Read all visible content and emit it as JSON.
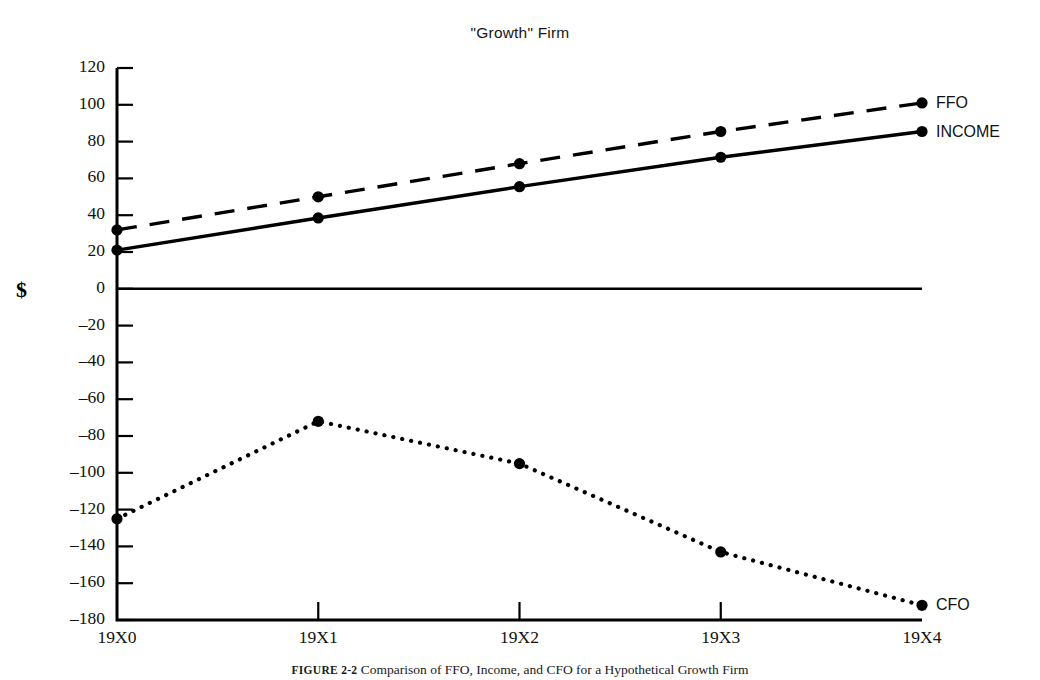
{
  "figure": {
    "caption_number": "FIGURE 2-2",
    "caption_text": "Comparison of FFO, Income, and CFO for a Hypothetical Growth Firm",
    "axis_unit_label": "$"
  },
  "chart_data": {
    "type": "line",
    "title": "\"Growth\" Firm",
    "xlabel": "",
    "ylabel": "$",
    "categories": [
      "19X0",
      "19X1",
      "19X2",
      "19X3",
      "19X4"
    ],
    "x": [
      "19X0",
      "19X1",
      "19X2",
      "19X3",
      "19X4"
    ],
    "ylim": [
      -180,
      120
    ],
    "ytick_labels": [
      "120",
      "100",
      "80",
      "60",
      "40",
      "20",
      "0",
      "–20",
      "–40",
      "–60",
      "–80",
      "–100",
      "–120",
      "–140",
      "–160",
      "–180"
    ],
    "yticks": [
      120,
      100,
      80,
      60,
      40,
      20,
      0,
      -20,
      -40,
      -60,
      -80,
      -100,
      -120,
      -140,
      -160,
      -180
    ],
    "ytick_step": 20,
    "grid": false,
    "legend_position": "right-of-line-ends",
    "zero_line": true,
    "series": [
      {
        "name": "FFO",
        "label": "FFO",
        "style": "dashed",
        "color": "#000000",
        "values": [
          32,
          50,
          68,
          85.5,
          101
        ]
      },
      {
        "name": "INCOME",
        "label": "INCOME",
        "style": "solid",
        "color": "#000000",
        "values": [
          21,
          38.5,
          55.5,
          71.5,
          85.5
        ]
      },
      {
        "name": "CFO",
        "label": "CFO",
        "style": "dotted",
        "color": "#000000",
        "values": [
          -125,
          -72,
          -95,
          -143,
          -172
        ]
      }
    ]
  }
}
